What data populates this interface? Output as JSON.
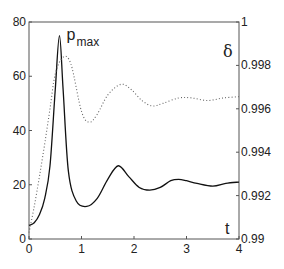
{
  "chart_data": {
    "type": "line",
    "title": "",
    "xlabel": "t",
    "ylabel_left": "",
    "ylabel_right": "δ",
    "xlim": [
      0,
      4
    ],
    "ylim_left": [
      0,
      80
    ],
    "ylim_right": [
      0.99,
      1.0
    ],
    "x_ticks": [
      "0",
      "1",
      "2",
      "3",
      "4"
    ],
    "y_ticks_left": [
      "0",
      "20",
      "40",
      "60",
      "80"
    ],
    "y_ticks_right": [
      "0.99",
      "0.992",
      "0.994",
      "0.996",
      "0.998",
      "1"
    ],
    "grid": false,
    "annotations": [
      {
        "text": "p",
        "subscript": "max",
        "x": 0.6,
        "y": 75
      }
    ],
    "series": [
      {
        "name": "p",
        "axis": "left",
        "style": "solid",
        "x": [
          0,
          0.1,
          0.2,
          0.3,
          0.4,
          0.5,
          0.58,
          0.65,
          0.75,
          0.9,
          1.1,
          1.3,
          1.5,
          1.7,
          1.9,
          2.1,
          2.3,
          2.5,
          2.7,
          2.85,
          3.0,
          3.2,
          3.5,
          3.75,
          4.0
        ],
        "values": [
          5,
          6,
          9,
          15,
          27,
          55,
          75,
          55,
          25,
          14,
          12,
          15,
          22,
          27,
          23,
          19,
          18,
          19,
          21.5,
          22,
          21.5,
          20.5,
          19.5,
          20.5,
          21
        ]
      },
      {
        "name": "δ",
        "axis": "right",
        "style": "dotted",
        "x": [
          0,
          0.1,
          0.2,
          0.3,
          0.4,
          0.5,
          0.65,
          0.8,
          1.0,
          1.15,
          1.3,
          1.5,
          1.75,
          1.95,
          2.15,
          2.35,
          2.55,
          2.85,
          3.1,
          3.4,
          3.7,
          4.0
        ],
        "values": [
          0.9903,
          0.9915,
          0.9929,
          0.9944,
          0.996,
          0.9976,
          0.99838,
          0.99805,
          0.99588,
          0.99538,
          0.99575,
          0.99663,
          0.99713,
          0.99688,
          0.99638,
          0.99613,
          0.99625,
          0.9965,
          0.9965,
          0.99638,
          0.9965,
          0.99656
        ]
      }
    ]
  }
}
